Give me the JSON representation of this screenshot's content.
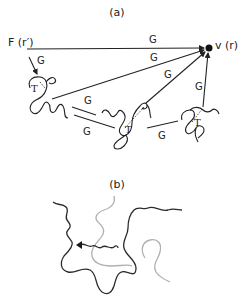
{
  "panel_a": {
    "title": "(a)",
    "node_f": "F (r′)",
    "node_v": "v (r)",
    "edge_label": "G",
    "edges": [
      {
        "from": "F",
        "to": "v",
        "label": "G"
      },
      {
        "from": "F",
        "to": "polymer1",
        "label": "G"
      },
      {
        "from": "polymer1",
        "to": "v",
        "label": "G"
      },
      {
        "from": "polymer1",
        "to": "polymer2",
        "label": "G"
      },
      {
        "from": "polymer1",
        "to": "polymer2",
        "label": "G"
      },
      {
        "from": "polymer2",
        "to": "v",
        "label": "G"
      },
      {
        "from": "polymer2",
        "to": "polymer3",
        "label": "G"
      },
      {
        "from": "polymer3",
        "to": "v",
        "label": "G"
      }
    ],
    "polymer_label": "T",
    "colors": {
      "ink": "#222222",
      "node": "#111111"
    }
  },
  "panel_b": {
    "title": "(b)",
    "colors": {
      "dark_chain": "#2a2a2a",
      "light_chain": "#b0b0b0"
    }
  }
}
